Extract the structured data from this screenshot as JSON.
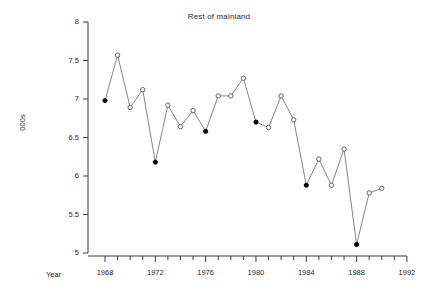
{
  "chart_data": {
    "type": "line",
    "title": "Rest of mainland",
    "xlabel": "Year",
    "ylabel": "000s",
    "xlim": [
      1967,
      1992.5
    ],
    "ylim": [
      5,
      8
    ],
    "grid": false,
    "legend": "none",
    "x_ticks_major": [
      1968,
      1972,
      1976,
      1980,
      1984,
      1988,
      1992
    ],
    "x_ticks_minor_step": 1,
    "y_ticks": [
      5,
      5.5,
      6,
      6.5,
      7,
      7.5,
      8
    ],
    "y_tick_labels": [
      "5",
      "5.5",
      "6",
      "6.5",
      "7",
      "7.5",
      "8"
    ],
    "marker_open_color": "#ffffff",
    "marker_edge_color": "#555555",
    "marker_filled_color": "#000000",
    "line_color": "#777777",
    "series": [
      {
        "name": "Rest of mainland",
        "x": [
          1968,
          1969,
          1970,
          1971,
          1972,
          1973,
          1974,
          1975,
          1976,
          1977,
          1978,
          1979,
          1980,
          1981,
          1982,
          1983,
          1984,
          1985,
          1986,
          1987,
          1988,
          1989,
          1990
        ],
        "values": [
          6.98,
          7.57,
          6.89,
          7.12,
          6.18,
          6.92,
          6.64,
          6.85,
          6.58,
          7.04,
          7.04,
          7.27,
          6.7,
          6.63,
          7.04,
          6.73,
          5.88,
          6.22,
          5.88,
          6.35,
          5.11,
          5.78,
          5.84
        ],
        "filled": [
          true,
          false,
          false,
          false,
          true,
          false,
          false,
          false,
          true,
          false,
          false,
          false,
          true,
          false,
          false,
          false,
          true,
          false,
          false,
          false,
          true,
          false,
          false
        ]
      }
    ]
  }
}
